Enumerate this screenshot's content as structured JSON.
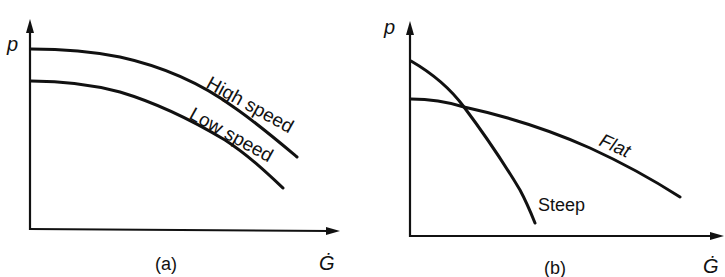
{
  "figure": {
    "panels": [
      {
        "id": "a",
        "caption": "(a)",
        "y_axis_label": "p",
        "x_axis_label": "Ġ",
        "curves": [
          {
            "name": "High speed",
            "label": "High speed"
          },
          {
            "name": "Low speed",
            "label": "Low speed"
          }
        ]
      },
      {
        "id": "b",
        "caption": "(b)",
        "y_axis_label": "p",
        "x_axis_label": "Ġ",
        "curves": [
          {
            "name": "Steep",
            "label": "Steep"
          },
          {
            "name": "Flat",
            "label": "Flat"
          }
        ]
      }
    ],
    "colors": {
      "line": "#111111",
      "background": "#ffffff"
    }
  }
}
